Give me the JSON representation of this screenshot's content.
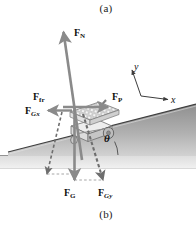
{
  "figure": {
    "caption_top": "(a)",
    "caption_bottom": "(b)",
    "background_color": "#ffffff"
  },
  "colors": {
    "incline_fill_top": "#9a9a9a",
    "incline_fill_bottom": "#c9c9c9",
    "incline_edge": "#4a4a4a",
    "arrow_solid": "#8a8a8a",
    "arrow_dashed": "#6e6e6e",
    "ground_line": "#777777",
    "label_text": "#111111",
    "mower_body": "#efefef",
    "mower_outline": "#6b6b6b"
  },
  "forces": [
    {
      "id": "normal-force",
      "symbol": "F",
      "subscript": "N",
      "subscript_italic": false,
      "style": "solid",
      "label_x": 74,
      "label_y": 28,
      "description": "normal force, perpendicular to incline, points up-right"
    },
    {
      "id": "friction-force",
      "symbol": "F",
      "subscript": "fr",
      "subscript_italic": false,
      "style": "solid",
      "label_x": 33,
      "label_y": 92,
      "description": "friction force, points left along horizontal"
    },
    {
      "id": "gravity-x-component",
      "symbol": "F",
      "subscript": "Gx",
      "subscript_italic": true,
      "style": "dashed",
      "label_x": 25,
      "label_y": 106,
      "description": "component of gravity parallel to incline"
    },
    {
      "id": "push-force",
      "symbol": "F",
      "subscript": "P",
      "subscript_italic": false,
      "style": "solid",
      "label_x": 112,
      "label_y": 92,
      "description": "applied push force, points right along horizontal"
    },
    {
      "id": "gravity-force",
      "symbol": "F",
      "subscript": "G",
      "subscript_italic": false,
      "style": "solid",
      "label_x": 64,
      "label_y": 188,
      "description": "weight, points straight down"
    },
    {
      "id": "gravity-y-component",
      "symbol": "F",
      "subscript": "Gy",
      "subscript_italic": true,
      "style": "dashed",
      "label_x": 98,
      "label_y": 188,
      "description": "component of gravity perpendicular to incline"
    }
  ],
  "axes": {
    "x_label": "x",
    "y_label": "y",
    "x_label_pos": [
      171,
      101
    ],
    "y_label_pos": [
      134,
      62
    ],
    "origin": [
      141,
      96
    ],
    "description": "tilted coordinate axes aligned with the incline"
  },
  "angle": {
    "symbol": "θ",
    "label_x": 104,
    "label_y": 133,
    "description": "incline angle between slope surface and horizontal"
  },
  "object": {
    "name": "lawn-mower",
    "description": "hatched-deck mower resting on the incline with a wheel and handle"
  }
}
